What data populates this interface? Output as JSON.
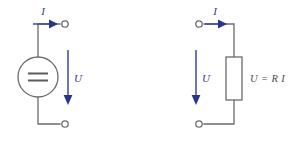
{
  "figure": {
    "title": "",
    "type": "circuit-diagram",
    "background_color": "#ffffff",
    "wire_color": "#6b6b6b",
    "arrow_color": "#27348b",
    "label_color": "#2f3a86",
    "equation_color": "#4a4a4a"
  },
  "circuits": [
    {
      "id": "voltage-source-circuit",
      "element_type": "dc-voltage-source",
      "element_symbol": "double-line-dc-source",
      "current_label": "I",
      "voltage_label": "U",
      "equation": "",
      "terminals": [
        {
          "name": "top-terminal",
          "x": 66,
          "y": 24
        },
        {
          "name": "bottom-terminal",
          "x": 66,
          "y": 124
        }
      ],
      "current_arrow": {
        "x1": 33,
        "y1": 24,
        "x2": 56,
        "y2": 24,
        "direction": "right"
      },
      "voltage_arrow": {
        "x1": 68,
        "y1": 50,
        "x2": 68,
        "y2": 104,
        "direction": "down"
      },
      "current_label_pos": {
        "x": 46,
        "y": 14
      },
      "voltage_label_pos": {
        "x": 74,
        "y": 80
      }
    },
    {
      "id": "resistor-circuit",
      "element_type": "resistor",
      "element_symbol": "rectangle-resistor",
      "current_label": "I",
      "voltage_label": "U",
      "equation": "U = R I",
      "terminals": [
        {
          "name": "top-terminal",
          "x": 198,
          "y": 24
        },
        {
          "name": "bottom-terminal",
          "x": 198,
          "y": 124
        }
      ],
      "current_arrow": {
        "x1": 204,
        "y1": 24,
        "x2": 227,
        "y2": 24,
        "direction": "right"
      },
      "voltage_arrow": {
        "x1": 196,
        "y1": 50,
        "x2": 196,
        "y2": 104,
        "direction": "down"
      },
      "current_label_pos": {
        "x": 217,
        "y": 14
      },
      "voltage_label_pos": {
        "x": 202,
        "y": 80
      },
      "equation_pos": {
        "x": 250,
        "y": 81
      }
    }
  ],
  "labels": {
    "left_current": "I",
    "left_voltage": "U",
    "right_current": "I",
    "right_voltage": "U",
    "ohms_law": "U = R I"
  }
}
